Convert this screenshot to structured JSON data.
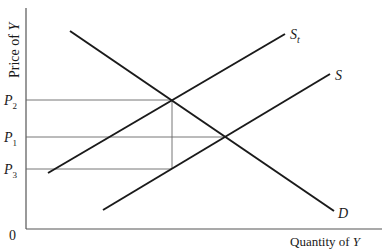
{
  "diagram": {
    "axes": {
      "y_label": "Price of",
      "y_var": "Y",
      "x_label": "Quantity of",
      "x_var": "Y",
      "origin": "0"
    },
    "price_levels": [
      {
        "id": "P2",
        "base": "P",
        "sub": "2"
      },
      {
        "id": "P1",
        "base": "P",
        "sub": "1"
      },
      {
        "id": "P3",
        "base": "P",
        "sub": "3"
      }
    ],
    "curves": {
      "demand": {
        "label": "D"
      },
      "supply": {
        "label": "S"
      },
      "supply_tax": {
        "label": "S",
        "sub": "t"
      }
    },
    "colors": {
      "line": "#1a1a1a",
      "guide": "#555555",
      "background": "#ffffff"
    }
  }
}
